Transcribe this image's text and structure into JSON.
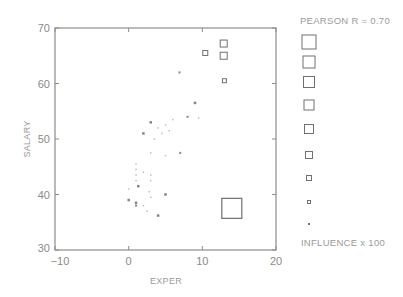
{
  "chart_data": {
    "type": "scatter",
    "title": "",
    "xlabel": "EXPER",
    "ylabel": "SALARY",
    "xlim": [
      -10,
      20
    ],
    "ylim": [
      30,
      70
    ],
    "xticks": [
      -10,
      0,
      10,
      20
    ],
    "yticks": [
      30,
      40,
      50,
      60,
      70
    ],
    "grid": false,
    "annotation": "PEARSON R = 0.70",
    "legend_title": "INFLUENCE x 100",
    "legend_position": "right",
    "legend_marker_sizes": [
      14,
      12,
      11,
      10,
      9,
      7,
      5,
      3,
      2
    ],
    "reference_marker": {
      "x": 14,
      "y": 37.5,
      "size": 20
    },
    "points": [
      {
        "x": 12.9,
        "y": 67.2,
        "size": 7
      },
      {
        "x": 12.9,
        "y": 65.0,
        "size": 7
      },
      {
        "x": 10.4,
        "y": 65.5,
        "size": 5
      },
      {
        "x": 13.0,
        "y": 60.5,
        "size": 4
      },
      {
        "x": 6.9,
        "y": 62.0,
        "size": 2
      },
      {
        "x": 9.0,
        "y": 56.5,
        "size": 2.5
      },
      {
        "x": 3.0,
        "y": 53.0,
        "size": 2.5
      },
      {
        "x": 2.0,
        "y": 51.0,
        "size": 2.5
      },
      {
        "x": 4.0,
        "y": 52.0,
        "size": 1.5
      },
      {
        "x": 5.0,
        "y": 52.5,
        "size": 1.5
      },
      {
        "x": 6.0,
        "y": 53.5,
        "size": 1.5
      },
      {
        "x": 8.0,
        "y": 54.0,
        "size": 2
      },
      {
        "x": 9.5,
        "y": 53.8,
        "size": 1.5
      },
      {
        "x": 4.5,
        "y": 51.0,
        "size": 1.5
      },
      {
        "x": 3.5,
        "y": 50.0,
        "size": 1.5
      },
      {
        "x": 5.5,
        "y": 51.5,
        "size": 1.5
      },
      {
        "x": 3.0,
        "y": 47.5,
        "size": 1.5
      },
      {
        "x": 5.0,
        "y": 47.0,
        "size": 1.5
      },
      {
        "x": 7.0,
        "y": 47.5,
        "size": 2
      },
      {
        "x": 1.0,
        "y": 45.5,
        "size": 1.5
      },
      {
        "x": 1.0,
        "y": 44.5,
        "size": 1.5
      },
      {
        "x": 1.0,
        "y": 43.5,
        "size": 1.5
      },
      {
        "x": 1.0,
        "y": 42.5,
        "size": 1.5
      },
      {
        "x": 2.0,
        "y": 44.0,
        "size": 1.5
      },
      {
        "x": 3.0,
        "y": 43.5,
        "size": 1.5
      },
      {
        "x": 3.0,
        "y": 42.5,
        "size": 1.5
      },
      {
        "x": 1.3,
        "y": 41.5,
        "size": 2.5
      },
      {
        "x": 0.0,
        "y": 41.0,
        "size": 1.5
      },
      {
        "x": 2.8,
        "y": 40.5,
        "size": 1.5
      },
      {
        "x": 3.0,
        "y": 39.5,
        "size": 1.5
      },
      {
        "x": 5.0,
        "y": 40.0,
        "size": 2.5
      },
      {
        "x": 0.0,
        "y": 39.0,
        "size": 2.5
      },
      {
        "x": 1.0,
        "y": 38.5,
        "size": 2.5
      },
      {
        "x": 1.0,
        "y": 38.0,
        "size": 2
      },
      {
        "x": 2.0,
        "y": 38.0,
        "size": 1.5
      },
      {
        "x": 2.5,
        "y": 37.0,
        "size": 1.5
      },
      {
        "x": 4.0,
        "y": 36.2,
        "size": 2.5
      }
    ]
  },
  "labels": {
    "annotation": "PEARSON R = 0.70",
    "legend_title": "INFLUENCE x 100",
    "xlabel": "EXPER",
    "ylabel": "SALARY"
  },
  "colors": {
    "axis": "#8c8c8c",
    "marker": "#707070",
    "text": "#8a8a8a"
  }
}
